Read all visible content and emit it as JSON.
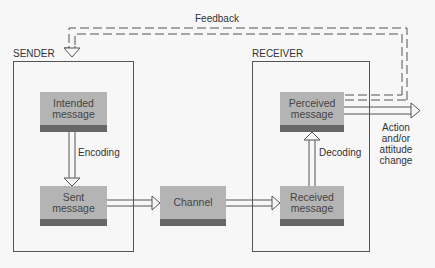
{
  "diagram": {
    "type": "communication-model",
    "feedback_label": "Feedback",
    "sender": {
      "label": "SENDER",
      "nodes": {
        "intended": "Intended message",
        "sent": "Sent message"
      },
      "edge_label": "Encoding"
    },
    "channel": "Channel",
    "receiver": {
      "label": "RECEIVER",
      "nodes": {
        "received": "Received message",
        "perceived": "Perceived message"
      },
      "edge_label": "Decoding"
    },
    "output_label": "Action and/or attitude change",
    "colors": {
      "box_fill": "#b4b4b4",
      "box_band": "#676767",
      "line": "#555555",
      "background": "#f7f7f7"
    }
  }
}
